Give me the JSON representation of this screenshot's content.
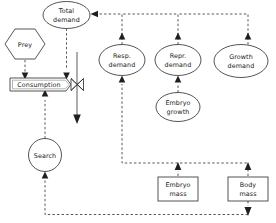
{
  "diagram": {
    "type": "flow-diagram",
    "background_color": "#ffffff",
    "stroke_color": "#2a2a2a",
    "text_color": "#1a1a1a",
    "nodes": [
      {
        "id": "total-demand",
        "label_line1": "Total",
        "label_line2": "demand",
        "shape": "ellipse",
        "cx": 66.5,
        "cy": 15,
        "rx": 23.5,
        "ry": 13.5
      },
      {
        "id": "prey",
        "label_line1": "Prey",
        "label_line2": "",
        "shape": "hexagon",
        "cx": 25,
        "cy": 44,
        "rx": 20,
        "ry": 16
      },
      {
        "id": "consumption",
        "label_line1": "Consumption",
        "label_line2": "",
        "shape": "flow-box",
        "x": 10,
        "y": 78,
        "w": 60,
        "h": 13
      },
      {
        "id": "search",
        "label_line1": "Search",
        "label_line2": "",
        "shape": "circle",
        "cx": 45,
        "cy": 155,
        "rx": 16.5,
        "ry": 16.5
      },
      {
        "id": "resp-demand",
        "label_line1": "Resp.",
        "label_line2": "demand",
        "shape": "ellipse",
        "cx": 122,
        "cy": 60,
        "rx": 23,
        "ry": 15.5
      },
      {
        "id": "repr-demand",
        "label_line1": "Repr.",
        "label_line2": "demand",
        "shape": "ellipse",
        "cx": 178,
        "cy": 60,
        "rx": 23,
        "ry": 15.5
      },
      {
        "id": "growth-demand",
        "label_line1": "Growth",
        "label_line2": "demand",
        "shape": "ellipse",
        "cx": 241,
        "cy": 61,
        "rx": 27,
        "ry": 16.5
      },
      {
        "id": "embryo-growth",
        "label_line1": "Embryo",
        "label_line2": "growth",
        "shape": "ellipse",
        "cx": 178,
        "cy": 107,
        "rx": 22,
        "ry": 14.5
      },
      {
        "id": "embryo-mass",
        "label_line1": "Embryo",
        "label_line2": "mass",
        "shape": "rect",
        "x": 158,
        "y": 177,
        "w": 40,
        "h": 24
      },
      {
        "id": "body-mass",
        "label_line1": "Body",
        "label_line2": "mass",
        "shape": "rect",
        "x": 228,
        "y": 177,
        "w": 40,
        "h": 24
      }
    ],
    "edges": [
      {
        "id": "prey-to-consumption",
        "from": "prey",
        "to": "consumption",
        "style": "dashed"
      },
      {
        "id": "total-demand-to-consumption",
        "from": "total-demand",
        "to": "consumption",
        "style": "dashed"
      },
      {
        "id": "search-to-consumption",
        "from": "search",
        "to": "consumption",
        "style": "dashed"
      },
      {
        "id": "consumption-outflow",
        "from": "consumption",
        "to": "sink",
        "style": "solid"
      },
      {
        "id": "resp-demand-to-total-demand",
        "from": "resp-demand",
        "to": "total-demand",
        "style": "dashed"
      },
      {
        "id": "repr-demand-to-total-demand",
        "from": "repr-demand",
        "to": "total-demand",
        "style": "dashed"
      },
      {
        "id": "growth-demand-to-total-demand",
        "from": "growth-demand",
        "to": "total-demand",
        "style": "dashed"
      },
      {
        "id": "embryo-growth-to-repr-demand",
        "from": "embryo-growth",
        "to": "repr-demand",
        "style": "dashed"
      },
      {
        "id": "embryo-mass-to-resp-demand",
        "from": "embryo-mass",
        "to": "resp-demand",
        "style": "dashed"
      },
      {
        "id": "body-mass-to-resp-demand",
        "from": "body-mass",
        "to": "resp-demand",
        "style": "dashed"
      },
      {
        "id": "body-mass-to-search",
        "from": "body-mass",
        "to": "search",
        "style": "dashed"
      }
    ]
  }
}
